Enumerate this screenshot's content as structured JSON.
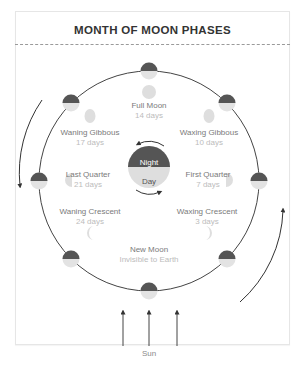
{
  "title": "MONTH OF MOON PHASES",
  "colors": {
    "dark_half": "#555555",
    "light_half": "#e3e3e3",
    "phase_moon": "#dedede",
    "orbit": "#444444"
  },
  "center": {
    "night_label": "Night",
    "day_label": "Day"
  },
  "phases": [
    {
      "name": "Full Moon",
      "detail": "14 days"
    },
    {
      "name": "Waning Gibbous",
      "detail": "17 days"
    },
    {
      "name": "Waxing Gibbous",
      "detail": "10 days"
    },
    {
      "name": "Last Quarter",
      "detail": "21 days"
    },
    {
      "name": "First Quarter",
      "detail": "7 days"
    },
    {
      "name": "Waning Crescent",
      "detail": "24 days"
    },
    {
      "name": "Waxing Crescent",
      "detail": "3 days"
    },
    {
      "name": "New Moon",
      "detail": "Invisible to Earth"
    }
  ],
  "sun_label": "Sun"
}
